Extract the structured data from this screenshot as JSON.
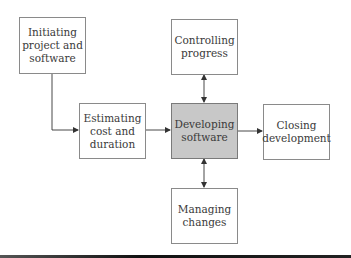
{
  "diagram": {
    "nodes": [
      {
        "id": "initiating",
        "label": "Initiating\nproject and\nsoftware",
        "highlighted": false
      },
      {
        "id": "estimating",
        "label": "Estimating\ncost and\nduration",
        "highlighted": false
      },
      {
        "id": "developing",
        "label": "Developing\nsoftware",
        "highlighted": true
      },
      {
        "id": "closing",
        "label": "Closing\ndevelopment",
        "highlighted": false
      },
      {
        "id": "controlling",
        "label": "Controlling\nprogress",
        "highlighted": false
      },
      {
        "id": "managing",
        "label": "Managing\nchanges",
        "highlighted": false
      }
    ],
    "edges": [
      {
        "from": "initiating",
        "to": "estimating",
        "type": "directed"
      },
      {
        "from": "estimating",
        "to": "developing",
        "type": "directed"
      },
      {
        "from": "developing",
        "to": "closing",
        "type": "directed"
      },
      {
        "from": "controlling",
        "to": "developing",
        "type": "bidirectional"
      },
      {
        "from": "developing",
        "to": "managing",
        "type": "bidirectional"
      }
    ],
    "colors": {
      "highlight_fill": "#c8c8c8",
      "border": "#8a8a8a",
      "line": "#333333"
    }
  }
}
